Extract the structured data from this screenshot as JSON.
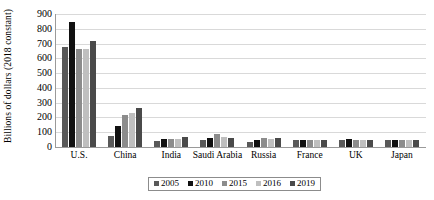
{
  "chart_data": {
    "type": "bar",
    "title": "",
    "xlabel": "",
    "ylabel": "Billions of dollars (2018 constant)",
    "ylim": [
      0,
      900
    ],
    "ytick_step": 100,
    "yticks": [
      0,
      100,
      200,
      300,
      400,
      500,
      600,
      700,
      800,
      900
    ],
    "grid": true,
    "legend_position": "bottom",
    "categories": [
      "U.S.",
      "China",
      "India",
      "Saudi Arabia",
      "Russia",
      "France",
      "UK",
      "Japan"
    ],
    "series": [
      {
        "name": "2005",
        "color": "#595959",
        "values": [
          680,
          75,
          40,
          45,
          35,
          50,
          50,
          45
        ]
      },
      {
        "name": "2010",
        "color": "#111111",
        "values": [
          845,
          140,
          55,
          60,
          50,
          50,
          55,
          50
        ]
      },
      {
        "name": "2015",
        "color": "#8c8c8c",
        "values": [
          665,
          215,
          55,
          90,
          60,
          45,
          50,
          45
        ]
      },
      {
        "name": "2016",
        "color": "#bfbfbf",
        "values": [
          660,
          230,
          55,
          65,
          55,
          45,
          45,
          45
        ]
      },
      {
        "name": "2019",
        "color": "#4a4a4a",
        "values": [
          715,
          265,
          70,
          60,
          60,
          48,
          48,
          45
        ]
      }
    ]
  },
  "colors": {
    "axis": "#9a9a9a",
    "grid": "#d9d9d9",
    "text": "#000000",
    "background": "#ffffff",
    "legend_border": "#8c8c8c"
  }
}
